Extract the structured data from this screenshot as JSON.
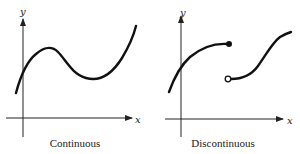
{
  "panels": [
    {
      "caption": "Continuous",
      "x_axis_label": "x",
      "y_axis_label": "y"
    },
    {
      "caption": "Discontinuous",
      "x_axis_label": "x",
      "y_axis_label": "y"
    }
  ],
  "colors": {
    "curve": "#111111",
    "axis": "#222222",
    "background": "#ffffff"
  }
}
